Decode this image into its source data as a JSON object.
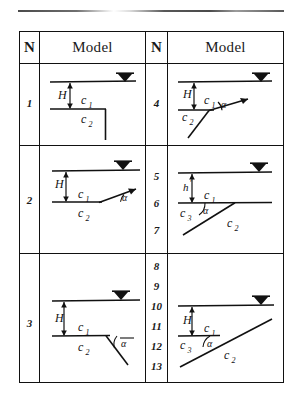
{
  "figure": {
    "type": "table-of-soil-model-diagrams",
    "columns": [
      "N",
      "Model",
      "N",
      "Model"
    ],
    "header": {
      "n_label": "N",
      "model_label": "Model"
    },
    "rows": [
      {
        "left": {
          "numbers": [
            "1"
          ],
          "model": {
            "water_table_marker": true,
            "labels": [
              "H",
              "c1",
              "c2"
            ],
            "shape": "horizontal layer boundary with vertical step down (no slope angle)",
            "angle_label": null
          }
        },
        "right": {
          "numbers": [
            "4"
          ],
          "model": {
            "water_table_marker": true,
            "labels": [
              "H",
              "c1",
              "c2",
              "alpha"
            ],
            "shape": "upward-right rising line from boundary with angle alpha, c2 below-left",
            "angle_label": "α"
          }
        }
      },
      {
        "left": {
          "numbers": [
            "2"
          ],
          "model": {
            "water_table_marker": true,
            "labels": [
              "H",
              "c1",
              "c2",
              "alpha"
            ],
            "shape": "boundary rising to the right at angle alpha",
            "angle_label": "α"
          }
        },
        "right": {
          "numbers": [
            "5",
            "6",
            "7"
          ],
          "model": {
            "water_table_marker": true,
            "labels": [
              "h'",
              "c1",
              "c3",
              "c2",
              "alpha"
            ],
            "shape": "three-layer wedge with inclined interface at angle alpha",
            "angle_label": "α"
          }
        }
      },
      {
        "left": {
          "numbers": [
            "3"
          ],
          "model": {
            "water_table_marker": true,
            "labels": [
              "H",
              "c1",
              "c2",
              "alpha"
            ],
            "shape": "boundary with line descending to the right, angle alpha measured above",
            "angle_label": "α"
          }
        },
        "right": {
          "numbers": [
            "8",
            "9",
            "10",
            "11",
            "12",
            "13"
          ],
          "model": {
            "water_table_marker": true,
            "labels": [
              "H",
              "c1",
              "c3",
              "c2",
              "alpha"
            ],
            "shape": "three-layer wedge with long inclined interface at angle alpha",
            "angle_label": "α"
          }
        }
      }
    ],
    "symbols": {
      "H": "H",
      "h_prime": "h'",
      "c1": "c",
      "c1_sub": "1",
      "c2": "c",
      "c2_sub": "2",
      "c3": "c",
      "c3_sub": "3",
      "alpha": "α"
    },
    "colors": {
      "ink": "#111111",
      "paper": "#ffffff"
    }
  }
}
